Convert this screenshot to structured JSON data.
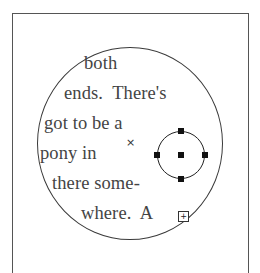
{
  "text_frame": {
    "shape": "ellipse",
    "lines": [
      "both",
      "ends.  There's",
      "got to be a",
      "pony in",
      "there some-",
      "where.  A"
    ],
    "center_marker": "×",
    "overflow_indicator": "+"
  },
  "selection": {
    "shape": "circle",
    "handles": [
      "top",
      "left",
      "center",
      "right",
      "bottom"
    ]
  },
  "colors": {
    "stroke": "#333333",
    "text": "#444444",
    "handle": "#111111",
    "background": "#ffffff"
  }
}
